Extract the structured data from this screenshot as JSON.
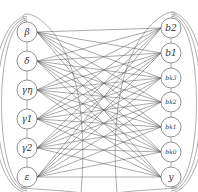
{
  "diagram": {
    "type": "bipartite-graph",
    "left_nodes": [
      {
        "id": "beta",
        "label": "β",
        "x": 27,
        "y": 32
      },
      {
        "id": "delta",
        "label": "δ",
        "x": 27,
        "y": 61
      },
      {
        "id": "gamma-eta",
        "label": "γη",
        "x": 27,
        "y": 90
      },
      {
        "id": "gamma1",
        "label": "γ1",
        "x": 27,
        "y": 119
      },
      {
        "id": "gamma2",
        "label": "γ2",
        "x": 27,
        "y": 148
      },
      {
        "id": "epsilon",
        "label": "ε",
        "x": 27,
        "y": 177
      }
    ],
    "right_nodes": [
      {
        "id": "b2",
        "label": "b2",
        "x": 171,
        "y": 28
      },
      {
        "id": "b1",
        "label": "b1",
        "x": 171,
        "y": 53
      },
      {
        "id": "bk3",
        "label": "bk3",
        "x": 171,
        "y": 78
      },
      {
        "id": "bk2",
        "label": "bk2",
        "x": 171,
        "y": 102
      },
      {
        "id": "bk1",
        "label": "bk1",
        "x": 171,
        "y": 127
      },
      {
        "id": "bk0",
        "label": "bk0",
        "x": 171,
        "y": 152
      },
      {
        "id": "y",
        "label": "y",
        "x": 171,
        "y": 177
      }
    ],
    "edges": "complete bipartite (every left node to every right node)",
    "node_radius": 10,
    "colors": {
      "edge": "#555555",
      "node_stroke": "#777777",
      "chain": "#888888",
      "arc": "#999999"
    }
  }
}
